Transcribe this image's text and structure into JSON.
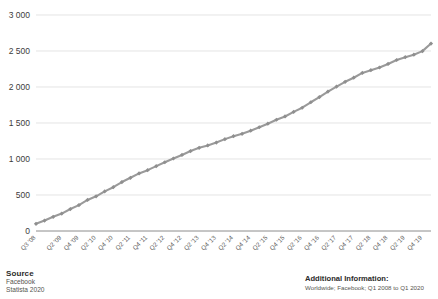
{
  "footer": {
    "source_title": "Source",
    "source_lines": [
      "Facebook",
      "Statista 2020"
    ],
    "additional_title": "Additional Information:",
    "additional_lines": [
      "Worldwide; Facebook; Q1 2008 to Q1 2020"
    ]
  },
  "colors": {
    "line": "#9a9a9a",
    "marker": "#8f8f8f",
    "grid": "#d9d9d9",
    "axis": "#8c8c8c",
    "text": "#3c3c3b"
  },
  "chart_data": {
    "type": "line",
    "title": "",
    "subtitle": "",
    "xlabel": "",
    "ylabel": "",
    "ylim": [
      0,
      3000
    ],
    "yticks": [
      0,
      500,
      1000,
      1500,
      2000,
      2500,
      3000
    ],
    "ytick_labels": [
      "0",
      "500",
      "1 000",
      "1 500",
      "2 000",
      "2 500",
      "3 000"
    ],
    "grid": true,
    "legend": false,
    "legend_position": "none",
    "marker": "diamond",
    "x": [
      "Q3 '08",
      "Q4 '08",
      "Q1 '09",
      "Q2 '09",
      "Q3 '09",
      "Q4 '09",
      "Q1 '10",
      "Q2 '10",
      "Q3 '10",
      "Q4 '10",
      "Q1 '11",
      "Q2 '11",
      "Q3 '11",
      "Q4 '11",
      "Q1 '12",
      "Q2 '12",
      "Q3 '12",
      "Q4 '12",
      "Q1 '13",
      "Q2 '13",
      "Q3 '13",
      "Q4 '13",
      "Q1 '14",
      "Q2 '14",
      "Q3 '14",
      "Q4 '14",
      "Q1 '15",
      "Q2 '15",
      "Q3 '15",
      "Q4 '15",
      "Q1 '16",
      "Q2 '16",
      "Q3 '16",
      "Q4 '16",
      "Q1 '17",
      "Q2 '17",
      "Q3 '17",
      "Q4 '17",
      "Q1 '18",
      "Q2 '18",
      "Q3 '18",
      "Q4 '18",
      "Q1 '19",
      "Q2 '19",
      "Q3 '19",
      "Q4 '19",
      "Q1 '20"
    ],
    "xtick_labels": [
      "Q3 '08",
      "Q2 '09",
      "Q4 '09",
      "Q2 '10",
      "Q4 '10",
      "Q2 '11",
      "Q4 '11",
      "Q2 '12",
      "Q4 '12",
      "Q2 '13",
      "Q4 '13",
      "Q2 '14",
      "Q4 '14",
      "Q2 '15",
      "Q4 '15",
      "Q2 '16",
      "Q4 '16",
      "Q2 '17",
      "Q4 '17",
      "Q2 '18",
      "Q4 '18",
      "Q2 '19",
      "Q4 '19"
    ],
    "xtick_indices": [
      0,
      3,
      5,
      7,
      9,
      11,
      13,
      15,
      17,
      19,
      21,
      23,
      25,
      27,
      29,
      31,
      33,
      35,
      37,
      39,
      41,
      43,
      45
    ],
    "values": [
      100,
      145,
      197,
      242,
      305,
      360,
      431,
      482,
      550,
      608,
      680,
      739,
      800,
      845,
      901,
      955,
      1007,
      1056,
      1110,
      1155,
      1189,
      1228,
      1276,
      1317,
      1350,
      1393,
      1441,
      1490,
      1545,
      1591,
      1654,
      1712,
      1788,
      1860,
      1936,
      2006,
      2072,
      2129,
      2196,
      2234,
      2271,
      2320,
      2375,
      2414,
      2449,
      2498,
      2603
    ],
    "series": [
      {
        "name": "Monthly active users (in millions)",
        "values": [
          100,
          145,
          197,
          242,
          305,
          360,
          431,
          482,
          550,
          608,
          680,
          739,
          800,
          845,
          901,
          955,
          1007,
          1056,
          1110,
          1155,
          1189,
          1228,
          1276,
          1317,
          1350,
          1393,
          1441,
          1490,
          1545,
          1591,
          1654,
          1712,
          1788,
          1860,
          1936,
          2006,
          2072,
          2129,
          2196,
          2234,
          2271,
          2320,
          2375,
          2414,
          2449,
          2498,
          2603
        ]
      }
    ]
  }
}
